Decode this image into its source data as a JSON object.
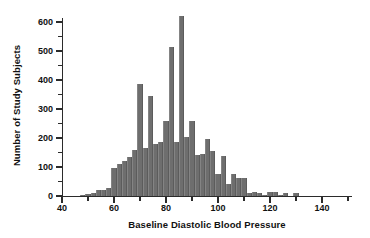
{
  "chart_data": {
    "type": "bar",
    "title": "",
    "subtitle": "",
    "xlabel": "Baseline Diastolic Blood Pressure",
    "ylabel": "Number of Study Subjects",
    "xlim": [
      40,
      151
    ],
    "ylim": [
      0,
      630
    ],
    "xticks": [
      40,
      60,
      80,
      100,
      120,
      140
    ],
    "xtick_labels": [
      "40",
      "60",
      "80",
      "100",
      "120",
      "140"
    ],
    "xticks_minor": [
      50,
      70,
      90,
      110,
      130,
      150
    ],
    "yticks": [
      0,
      100,
      200,
      300,
      400,
      500,
      600
    ],
    "ytick_labels": [
      "0",
      "100",
      "200",
      "300",
      "400",
      "500",
      "600"
    ],
    "yticks_minor": [
      50,
      150,
      250,
      350,
      450,
      550
    ],
    "grid": false,
    "legend": false,
    "bin_width": 2,
    "bar_color": "#6e6e6e",
    "categories": [
      48,
      50,
      52,
      54,
      56,
      58,
      60,
      62,
      64,
      66,
      68,
      70,
      72,
      74,
      76,
      78,
      80,
      82,
      84,
      86,
      88,
      90,
      92,
      94,
      96,
      98,
      100,
      102,
      104,
      106,
      108,
      110,
      112,
      114,
      116,
      118,
      120,
      122,
      124,
      126,
      128,
      130
    ],
    "values": [
      5,
      8,
      12,
      20,
      22,
      28,
      97,
      110,
      120,
      135,
      160,
      385,
      165,
      345,
      180,
      185,
      260,
      515,
      185,
      620,
      205,
      260,
      140,
      145,
      198,
      155,
      75,
      137,
      40,
      75,
      62,
      62,
      12,
      15,
      12,
      5,
      15,
      15,
      5,
      10,
      0,
      10
    ]
  }
}
